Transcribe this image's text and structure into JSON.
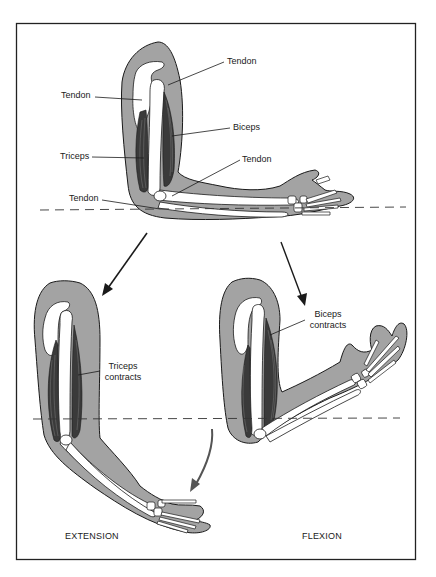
{
  "diagram": {
    "colors": {
      "skin": "#a3a3a3",
      "bone": "#ffffff",
      "muscle": "#3a3a3a",
      "outline": "#1a1a1a",
      "curved_arrow": "#555555",
      "frame": "#222222"
    },
    "top_arm": {
      "state": "relaxed, forearm horizontal",
      "labels": [
        {
          "id": "tendon-top-right",
          "text": "Tendon"
        },
        {
          "id": "tendon-top-left",
          "text": "Tendon"
        },
        {
          "id": "biceps",
          "text": "Biceps"
        },
        {
          "id": "triceps",
          "text": "Triceps"
        },
        {
          "id": "tendon-elbow-right",
          "text": "Tendon"
        },
        {
          "id": "tendon-elbow-left",
          "text": "Tendon"
        }
      ]
    },
    "extension_arm": {
      "label_line1": "Triceps",
      "label_line2": "contracts",
      "caption": "EXTENSION"
    },
    "flexion_arm": {
      "label_line1": "Biceps",
      "label_line2": "contracts",
      "caption": "FLEXION"
    },
    "arrows": [
      {
        "id": "to-extension",
        "from": "top arm",
        "to": "extension arm"
      },
      {
        "id": "to-flexion",
        "from": "top arm",
        "to": "flexion arm"
      },
      {
        "id": "extension-motion",
        "type": "curved",
        "meaning": "forearm moves down"
      }
    ],
    "reference_lines": [
      {
        "id": "top-dashed",
        "style": "dashed"
      },
      {
        "id": "bottom-dashed",
        "style": "dashed"
      }
    ]
  }
}
